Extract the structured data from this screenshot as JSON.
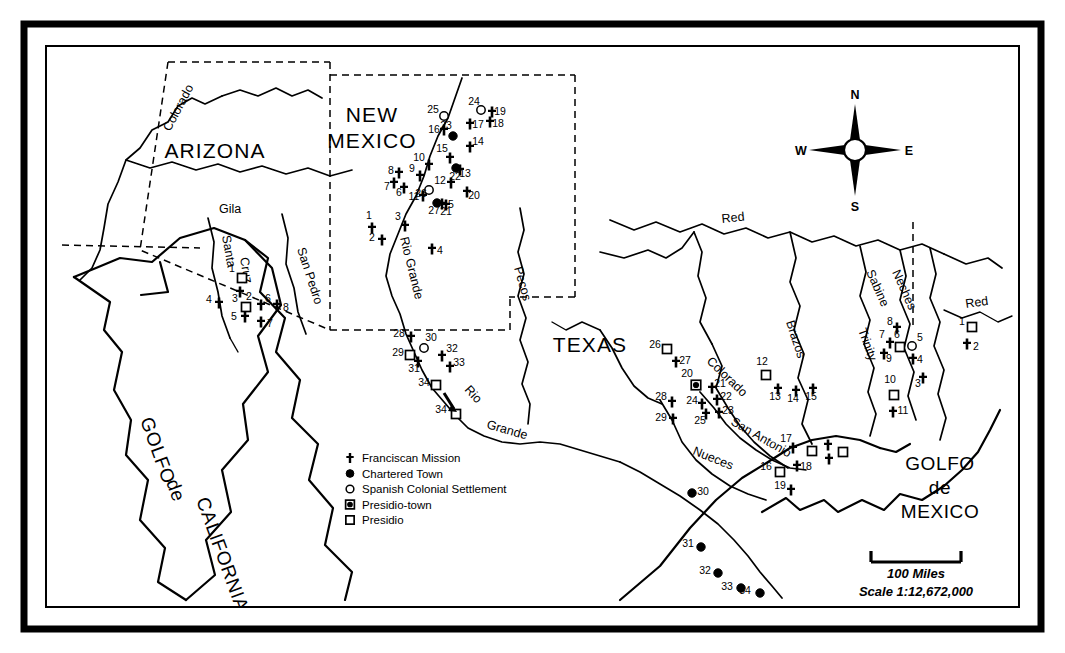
{
  "regions": [
    {
      "name": "arizona",
      "label": "ARIZONA",
      "x": 215,
      "y": 158
    },
    {
      "name": "new-mexico",
      "label_line1": "NEW",
      "label_line2": "MEXICO",
      "x": 372,
      "y": 122
    },
    {
      "name": "texas",
      "label": "TEXAS",
      "x": 590,
      "y": 352
    }
  ],
  "water_bodies": [
    {
      "name": "golfo-de-california",
      "lines": [
        "GOLFO",
        "de",
        "CALIFORNIA"
      ]
    },
    {
      "name": "golfo-de-mexico",
      "lines": [
        "GOLFO",
        "de",
        "MEXICO"
      ],
      "x": 940,
      "y": 468
    }
  ],
  "rivers": [
    {
      "name": "colorado-west",
      "label": "Colorado"
    },
    {
      "name": "gila",
      "label": "Gila"
    },
    {
      "name": "santa-cruz",
      "label": "Santa"
    },
    {
      "name": "cruz",
      "label": "Cruz"
    },
    {
      "name": "san-pedro",
      "label": "San Pedro"
    },
    {
      "name": "rio-grande-north",
      "label": "Rio Grande"
    },
    {
      "name": "rio-grande-south-1",
      "label": "Rio"
    },
    {
      "name": "rio-grande-south-2",
      "label": "Grande"
    },
    {
      "name": "pecos",
      "label": "Pecos"
    },
    {
      "name": "red-north",
      "label": "Red"
    },
    {
      "name": "red-east",
      "label": "Red"
    },
    {
      "name": "sabine",
      "label": "Sabine"
    },
    {
      "name": "neches",
      "label": "Neches"
    },
    {
      "name": "trinity",
      "label": "Trinity"
    },
    {
      "name": "brazos",
      "label": "Brazos"
    },
    {
      "name": "colorado-texas",
      "label": "Colorado"
    },
    {
      "name": "san-antonio",
      "label": "San Antonio"
    },
    {
      "name": "nueces",
      "label": "Nueces"
    }
  ],
  "legend": {
    "name": "map-legend",
    "items": [
      {
        "symbol": "cross",
        "label": "Franciscan Mission"
      },
      {
        "symbol": "filled-circle",
        "label": "Chartered Town"
      },
      {
        "symbol": "open-circle",
        "label": "Spanish Colonial Settlement"
      },
      {
        "symbol": "presidio-town",
        "label": "Presidio-town"
      },
      {
        "symbol": "open-square",
        "label": "Presidio"
      }
    ]
  },
  "scale": {
    "name": "scale-bar",
    "bar_label": "100 Miles",
    "ratio_label": "Scale  1:12,672,000"
  },
  "compass": {
    "name": "compass-rose",
    "north": "N",
    "south": "S",
    "east": "E",
    "west": "W"
  },
  "colors": {
    "ink": "#000000",
    "paper": "#ffffff"
  },
  "map_symbols": {
    "arizona_group": [
      {
        "id": "1",
        "type": "open-square",
        "x": 242,
        "y": 278,
        "lx": 232,
        "ly": 272
      },
      {
        "id": "2",
        "type": "cross",
        "x": 240,
        "y": 292,
        "lx": 249,
        "ly": 300
      },
      {
        "id": "3",
        "type": "open-square",
        "x": 246,
        "y": 307,
        "lx": 235,
        "ly": 302
      },
      {
        "id": "4",
        "type": "cross",
        "x": 219,
        "y": 303,
        "lx": 209,
        "ly": 303
      },
      {
        "id": "5",
        "type": "cross",
        "x": 245,
        "y": 317,
        "lx": 234,
        "ly": 320
      },
      {
        "id": "6",
        "type": "cross",
        "x": 261,
        "y": 305,
        "lx": 268,
        "ly": 302
      },
      {
        "id": "7",
        "type": "cross",
        "x": 261,
        "y": 322,
        "lx": 270,
        "ly": 327
      },
      {
        "id": "8",
        "type": "cross",
        "x": 277,
        "y": 305,
        "lx": 286,
        "ly": 311
      }
    ],
    "new_mexico_group": [
      {
        "id": "1",
        "type": "cross",
        "x": 372,
        "y": 228,
        "lx": 369,
        "ly": 219
      },
      {
        "id": "2",
        "type": "cross",
        "x": 382,
        "y": 240,
        "lx": 372,
        "ly": 241
      },
      {
        "id": "3",
        "type": "cross",
        "x": 405,
        "y": 226,
        "lx": 398,
        "ly": 220
      },
      {
        "id": "4",
        "type": "cross",
        "x": 432,
        "y": 249,
        "lx": 440,
        "ly": 254
      },
      {
        "id": "5",
        "type": "cross",
        "x": 442,
        "y": 204,
        "lx": 451,
        "ly": 208
      },
      {
        "id": "6",
        "type": "cross",
        "x": 404,
        "y": 188,
        "lx": 399,
        "ly": 196
      },
      {
        "id": "7",
        "type": "cross",
        "x": 394,
        "y": 183,
        "lx": 387,
        "ly": 190
      },
      {
        "id": "8",
        "type": "cross",
        "x": 399,
        "y": 173,
        "lx": 391,
        "ly": 174
      },
      {
        "id": "9",
        "type": "cross",
        "x": 420,
        "y": 176,
        "lx": 412,
        "ly": 172
      },
      {
        "id": "10",
        "type": "cross",
        "x": 429,
        "y": 165,
        "lx": 419,
        "ly": 161
      },
      {
        "id": "11",
        "type": "cross",
        "x": 423,
        "y": 196,
        "lx": 414,
        "ly": 200
      },
      {
        "id": "12",
        "type": "cross",
        "x": 451,
        "y": 183,
        "lx": 440,
        "ly": 184
      },
      {
        "id": "13",
        "type": "cross",
        "x": 460,
        "y": 170,
        "lx": 465,
        "ly": 177
      },
      {
        "id": "14",
        "type": "cross",
        "x": 470,
        "y": 147,
        "lx": 478,
        "ly": 145
      },
      {
        "id": "15",
        "type": "cross",
        "x": 450,
        "y": 158,
        "lx": 442,
        "ly": 152
      },
      {
        "id": "16",
        "type": "cross",
        "x": 444,
        "y": 130,
        "lx": 434,
        "ly": 133
      },
      {
        "id": "17",
        "type": "cross",
        "x": 470,
        "y": 124,
        "lx": 478,
        "ly": 128
      },
      {
        "id": "18",
        "type": "cross",
        "x": 490,
        "y": 122,
        "lx": 498,
        "ly": 127
      },
      {
        "id": "19",
        "type": "cross",
        "x": 492,
        "y": 112,
        "lx": 500,
        "ly": 115
      },
      {
        "id": "20",
        "type": "cross",
        "x": 467,
        "y": 192,
        "lx": 474,
        "ly": 199
      },
      {
        "id": "21",
        "type": "cross",
        "x": 446,
        "y": 205,
        "lx": 446,
        "ly": 215
      },
      {
        "id": "22",
        "type": "filled-circle",
        "x": 456,
        "y": 168,
        "lx": 455,
        "ly": 180
      },
      {
        "id": "23",
        "type": "filled-circle",
        "x": 453,
        "y": 136,
        "lx": 446,
        "ly": 129
      },
      {
        "id": "24",
        "type": "open-circle",
        "x": 481,
        "y": 110,
        "lx": 474,
        "ly": 105
      },
      {
        "id": "25",
        "type": "open-circle",
        "x": 444,
        "y": 116,
        "lx": 433,
        "ly": 113
      },
      {
        "id": "26",
        "type": "open-circle",
        "x": 429,
        "y": 190,
        "lx": 421,
        "ly": 197
      },
      {
        "id": "27",
        "type": "filled-circle",
        "x": 437,
        "y": 203,
        "lx": 434,
        "ly": 214
      }
    ],
    "rio_grande_group": [
      {
        "id": "28",
        "type": "cross",
        "x": 411,
        "y": 337,
        "lx": 399,
        "ly": 337
      },
      {
        "id": "29",
        "type": "open-square",
        "x": 410,
        "y": 355,
        "lx": 398,
        "ly": 356
      },
      {
        "id": "30",
        "type": "open-circle",
        "x": 424,
        "y": 348,
        "lx": 431,
        "ly": 341
      },
      {
        "id": "31",
        "type": "cross",
        "x": 418,
        "y": 362,
        "lx": 414,
        "ly": 372
      },
      {
        "id": "32",
        "type": "cross",
        "x": 442,
        "y": 356,
        "lx": 452,
        "ly": 352
      },
      {
        "id": "33",
        "type": "cross",
        "x": 450,
        "y": 367,
        "lx": 459,
        "ly": 366
      },
      {
        "id": "34",
        "type": "open-square",
        "x": 436,
        "y": 385,
        "lx": 424,
        "ly": 386
      },
      {
        "id": "34",
        "type": "open-square",
        "x": 456,
        "y": 414,
        "lx": 441,
        "ly": 413
      }
    ],
    "texas_east_group": [
      {
        "id": "1",
        "type": "open-square",
        "x": 972,
        "y": 327,
        "lx": 962,
        "ly": 325
      },
      {
        "id": "2",
        "type": "cross",
        "x": 967,
        "y": 344,
        "lx": 976,
        "ly": 350
      },
      {
        "id": "3",
        "type": "cross",
        "x": 923,
        "y": 378,
        "lx": 918,
        "ly": 387
      },
      {
        "id": "4",
        "type": "cross",
        "x": 913,
        "y": 359,
        "lx": 920,
        "ly": 363
      },
      {
        "id": "5",
        "type": "open-circle",
        "x": 912,
        "y": 346,
        "lx": 920,
        "ly": 341
      },
      {
        "id": "6",
        "type": "open-square",
        "x": 900,
        "y": 347,
        "lx": 897,
        "ly": 338
      },
      {
        "id": "7",
        "type": "cross",
        "x": 890,
        "y": 343,
        "lx": 882,
        "ly": 338
      },
      {
        "id": "8",
        "type": "cross",
        "x": 897,
        "y": 328,
        "lx": 890,
        "ly": 325
      },
      {
        "id": "9",
        "type": "cross",
        "x": 884,
        "y": 354,
        "lx": 889,
        "ly": 362
      },
      {
        "id": "10",
        "type": "open-square",
        "x": 894,
        "y": 395,
        "lx": 890,
        "ly": 383
      },
      {
        "id": "11",
        "type": "cross",
        "x": 893,
        "y": 412,
        "lx": 903,
        "ly": 414
      }
    ],
    "texas_central_group": [
      {
        "id": "12",
        "type": "open-square",
        "x": 766,
        "y": 375,
        "lx": 762,
        "ly": 365
      },
      {
        "id": "13",
        "type": "cross",
        "x": 778,
        "y": 389,
        "lx": 775,
        "ly": 400
      },
      {
        "id": "14",
        "type": "cross",
        "x": 796,
        "y": 391,
        "lx": 793,
        "ly": 402
      },
      {
        "id": "15",
        "type": "cross",
        "x": 813,
        "y": 389,
        "lx": 811,
        "ly": 400
      },
      {
        "id": "16",
        "type": "open-square",
        "x": 780,
        "y": 472,
        "lx": 766,
        "ly": 470
      },
      {
        "id": "17",
        "type": "cross",
        "x": 793,
        "y": 448,
        "lx": 786,
        "ly": 442
      },
      {
        "id": "18",
        "type": "cross",
        "x": 797,
        "y": 466,
        "lx": 806,
        "ly": 470
      },
      {
        "id": "19",
        "type": "cross",
        "x": 791,
        "y": 490,
        "lx": 780,
        "ly": 489
      },
      {
        "id": "20",
        "type": "presidio-town",
        "x": 696,
        "y": 385,
        "lx": 687,
        "ly": 377
      },
      {
        "id": "21",
        "type": "cross",
        "x": 712,
        "y": 388,
        "lx": 720,
        "ly": 387
      },
      {
        "id": "22",
        "type": "cross",
        "x": 717,
        "y": 400,
        "lx": 726,
        "ly": 400
      },
      {
        "id": "23",
        "type": "cross",
        "x": 719,
        "y": 413,
        "lx": 728,
        "ly": 414
      },
      {
        "id": "24",
        "type": "cross",
        "x": 702,
        "y": 404,
        "lx": 692,
        "ly": 404
      },
      {
        "id": "25",
        "type": "cross",
        "x": 706,
        "y": 414,
        "lx": 700,
        "ly": 424
      },
      {
        "id": "26",
        "type": "open-square",
        "x": 667,
        "y": 349,
        "lx": 655,
        "ly": 348
      },
      {
        "id": "27",
        "type": "cross",
        "x": 676,
        "y": 362,
        "lx": 685,
        "ly": 364
      },
      {
        "id": "28",
        "type": "cross",
        "x": 672,
        "y": 402,
        "lx": 661,
        "ly": 400
      },
      {
        "id": "29",
        "type": "cross",
        "x": 673,
        "y": 419,
        "lx": 661,
        "ly": 421
      },
      {
        "id": "17b",
        "type": "open-square",
        "x": 812,
        "y": 451,
        "lx": null,
        "ly": null
      },
      {
        "id": "17c",
        "type": "cross",
        "x": 828,
        "y": 445,
        "lx": null,
        "ly": null
      },
      {
        "id": "18b",
        "type": "open-square",
        "x": 843,
        "y": 452,
        "lx": null,
        "ly": null
      },
      {
        "id": "18c",
        "type": "cross",
        "x": 829,
        "y": 459,
        "lx": null,
        "ly": null
      }
    ],
    "mexico_towns_group": [
      {
        "id": "30",
        "type": "filled-circle",
        "x": 692,
        "y": 493,
        "lx": 703,
        "ly": 495
      },
      {
        "id": "31",
        "type": "filled-circle",
        "x": 701,
        "y": 547,
        "lx": 688,
        "ly": 547
      },
      {
        "id": "32",
        "type": "filled-circle",
        "x": 718,
        "y": 573,
        "lx": 705,
        "ly": 574
      },
      {
        "id": "33",
        "type": "filled-circle",
        "x": 741,
        "y": 588,
        "lx": 727,
        "ly": 590
      },
      {
        "id": "34",
        "type": "filled-circle",
        "x": 760,
        "y": 593,
        "lx": 745,
        "ly": 594
      }
    ]
  }
}
